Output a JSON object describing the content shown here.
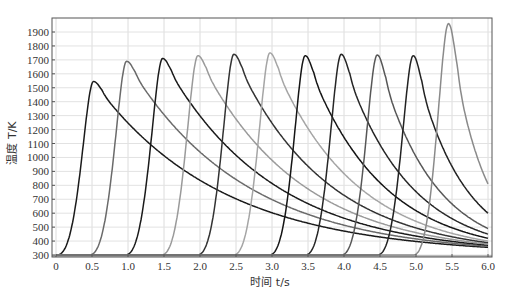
{
  "chart_data": {
    "type": "line",
    "title": "",
    "xlabel": "时间 t/s",
    "ylabel": "温度 T/K",
    "xlim": [
      0,
      6.0
    ],
    "ylim": [
      300,
      1950
    ],
    "xticks": [
      "0",
      "0.5",
      "1.0",
      "1.5",
      "2.0",
      "2.5",
      "3.0",
      "3.5",
      "4.0",
      "4.5",
      "5.0",
      "5.5",
      "6.0"
    ],
    "yticks": [
      "300",
      "400",
      "500",
      "600",
      "700",
      "800",
      "900",
      "1000",
      "1100",
      "1200",
      "1300",
      "1400",
      "1500",
      "1600",
      "1700",
      "1800",
      "1900"
    ],
    "grid": true,
    "legend": null,
    "series": [
      {
        "name": "pass 1",
        "rise_start": 0.0,
        "peak_t": 0.52,
        "peak": 1545,
        "end_value": 355,
        "color": "#1a1a1a"
      },
      {
        "name": "pass 2",
        "rise_start": 0.45,
        "peak_t": 0.98,
        "peak": 1690,
        "end_value": 362,
        "color": "#6a6a6a"
      },
      {
        "name": "pass 3",
        "rise_start": 0.95,
        "peak_t": 1.48,
        "peak": 1710,
        "end_value": 370,
        "color": "#1a1a1a"
      },
      {
        "name": "pass 4",
        "rise_start": 1.45,
        "peak_t": 1.97,
        "peak": 1730,
        "end_value": 378,
        "color": "#9a9a9a"
      },
      {
        "name": "pass 5",
        "rise_start": 1.95,
        "peak_t": 2.47,
        "peak": 1740,
        "end_value": 388,
        "color": "#333333"
      },
      {
        "name": "pass 6",
        "rise_start": 2.45,
        "peak_t": 2.97,
        "peak": 1750,
        "end_value": 400,
        "color": "#a5a5a5"
      },
      {
        "name": "pass 7",
        "rise_start": 2.95,
        "peak_t": 3.46,
        "peak": 1730,
        "end_value": 420,
        "color": "#151515"
      },
      {
        "name": "pass 8",
        "rise_start": 3.45,
        "peak_t": 3.96,
        "peak": 1740,
        "end_value": 450,
        "color": "#262626"
      },
      {
        "name": "pass 9",
        "rise_start": 3.95,
        "peak_t": 4.46,
        "peak": 1735,
        "end_value": 490,
        "color": "#575757"
      },
      {
        "name": "pass 10",
        "rise_start": 4.45,
        "peak_t": 4.96,
        "peak": 1730,
        "end_value": 600,
        "color": "#222222"
      },
      {
        "name": "pass 11",
        "rise_start": 4.95,
        "peak_t": 5.45,
        "peak": 1960,
        "end_value": 810,
        "color": "#8a8a8a"
      }
    ]
  }
}
